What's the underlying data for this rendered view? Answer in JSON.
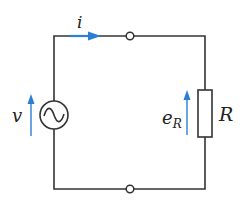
{
  "diagram": {
    "type": "electric-circuit",
    "colors": {
      "wire": "#333333",
      "arrow": "#2a7fd4",
      "background": "#ffffff"
    },
    "components": {
      "source": {
        "kind": "ac-voltage-source",
        "label": "v"
      },
      "resistor": {
        "kind": "resistor",
        "label": "R",
        "voltage_label_main": "e",
        "voltage_label_sub": "R"
      },
      "current": {
        "label": "i"
      },
      "terminals": [
        "top-terminal",
        "bottom-terminal"
      ]
    }
  }
}
